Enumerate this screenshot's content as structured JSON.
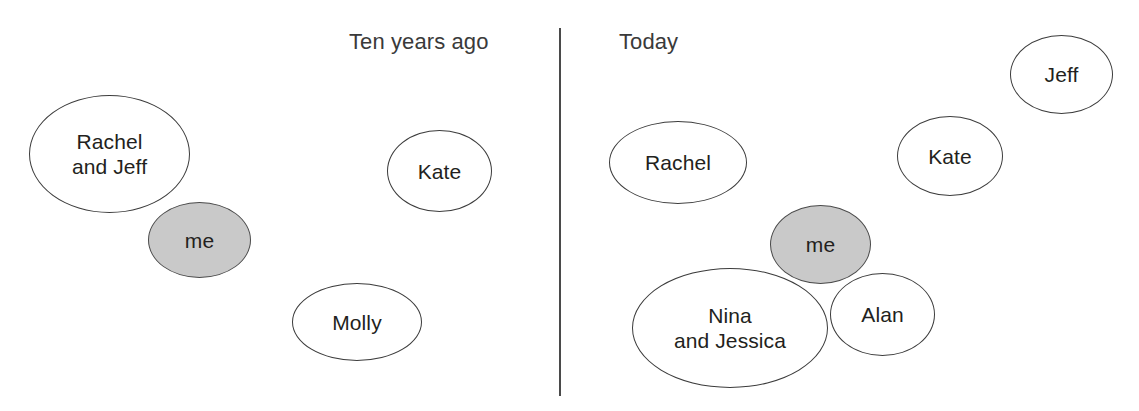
{
  "figure": {
    "type": "diagram"
  },
  "divider": {
    "name": "vertical-divider",
    "color": "#4a4a4a"
  },
  "panels": [
    {
      "id": "left",
      "title": "Ten years ago",
      "bubbles": [
        {
          "id": "l-rachel-jeff",
          "label": "Rachel\nand Jeff",
          "shaded": false
        },
        {
          "id": "l-me",
          "label": "me",
          "shaded": true
        },
        {
          "id": "l-kate",
          "label": "Kate",
          "shaded": false
        },
        {
          "id": "l-molly",
          "label": "Molly",
          "shaded": false
        }
      ]
    },
    {
      "id": "right",
      "title": "Today",
      "bubbles": [
        {
          "id": "r-rachel",
          "label": "Rachel",
          "shaded": false
        },
        {
          "id": "r-me",
          "label": "me",
          "shaded": true
        },
        {
          "id": "r-nina-jess",
          "label": "Nina\nand Jessica",
          "shaded": false
        },
        {
          "id": "r-alan",
          "label": "Alan",
          "shaded": false
        },
        {
          "id": "r-kate",
          "label": "Kate",
          "shaded": false
        },
        {
          "id": "r-jeff",
          "label": "Jeff",
          "shaded": false
        }
      ]
    }
  ],
  "colors": {
    "bubble_fill": "#ffffff",
    "bubble_stroke": "#3c3c3c",
    "shaded_fill": "#c9c9c9",
    "text": "#231f20",
    "background": "#ffffff"
  }
}
